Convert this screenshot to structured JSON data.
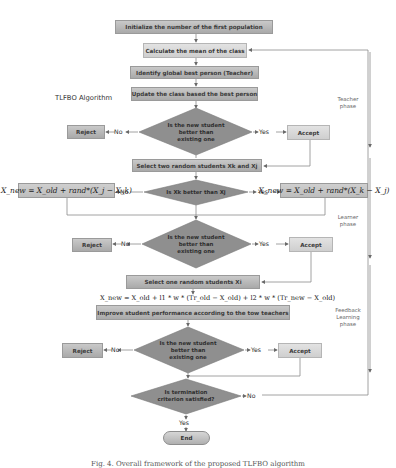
{
  "diagram": {
    "title": "TLFBO Algorithm",
    "nodes": {
      "init": "Initialize the number of the first population",
      "mean": "Calculate the mean of the class",
      "teacher": "Identify global best person (Teacher)",
      "update": "Update the class based the best person",
      "decision1": [
        "Is the new student",
        "better than",
        "existing one"
      ],
      "reject1": "Reject",
      "accept1": "Accept",
      "select_two": "Select two random students Xk and Xj",
      "decision2": "Is Xk better than Xj",
      "formula_left": "X_new = X_old + rand*(X_j − X_k)",
      "formula_right": "X_new = X_old + rand*(X_k − X_j)",
      "decision3": [
        "Is the new student",
        "better than",
        "existing one"
      ],
      "reject2": "Reject",
      "accept2": "Accept",
      "select_one": "Select one random students Xi",
      "formula_feedback": "X_new = X_old + l1 * w * (Tr_old − X_old) + l2 * w * (Tr_new − X_old)",
      "improve": "Improve student performance according to the tow teachers",
      "decision4": [
        "Is the new student",
        "better than",
        "existing one"
      ],
      "reject3": "Reject",
      "accept3": "Accept",
      "decision5": [
        "Is termination",
        "criterion satisfied?"
      ],
      "end": "End"
    },
    "edge_labels": {
      "yes": "Yes",
      "no": "No"
    },
    "phases": {
      "teacher": [
        "Teacher",
        "phase"
      ],
      "learner": [
        "Learner",
        "phase"
      ],
      "feedback": [
        "Feedback",
        "Learning",
        "phase"
      ]
    },
    "colors": {
      "box_fill": "#b9b9b9",
      "box_light_fill": "#d9d9d9",
      "diamond_fill": "#8f8f8f",
      "line": "#8a8a8a",
      "text": "#333333"
    }
  },
  "caption": "Fig. 4. Overall framework of the proposed TLFBO algorithm"
}
